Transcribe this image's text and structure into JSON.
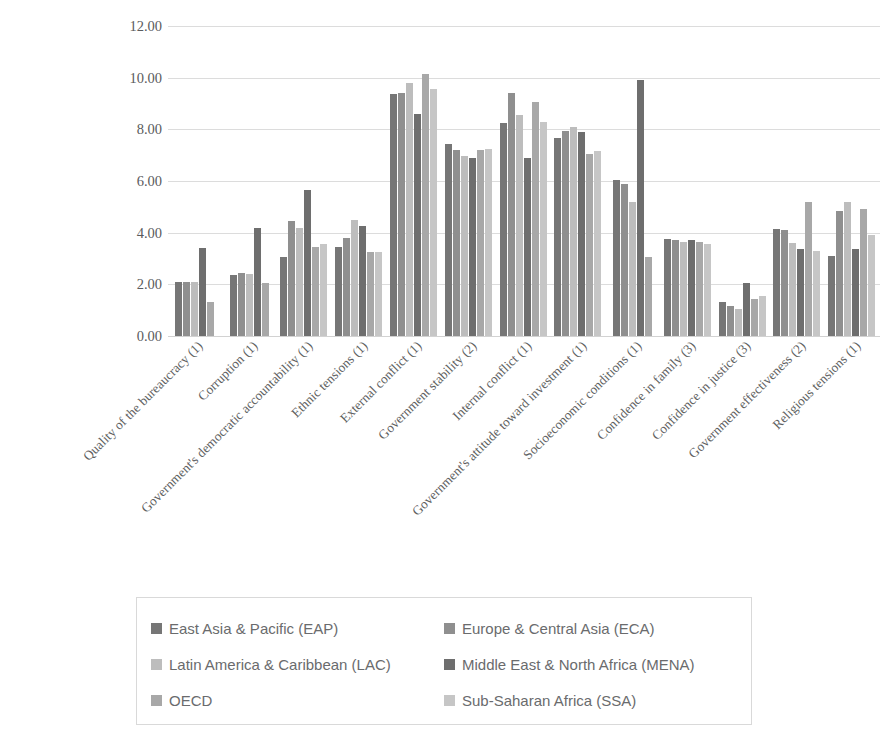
{
  "chart_data": {
    "type": "bar",
    "title": "",
    "xlabel": "",
    "ylabel": "",
    "ylim": [
      0,
      12
    ],
    "ytick_labels": [
      "0.00",
      "2.00",
      "4.00",
      "6.00",
      "8.00",
      "10.00",
      "12.00"
    ],
    "ytick_values": [
      0,
      2,
      4,
      6,
      8,
      10,
      12
    ],
    "grid": true,
    "legend_position": "bottom",
    "categories": [
      "Quality of the bureaucracy (1)",
      "Corruption (1)",
      "Government's democratic accountability (1)",
      "Ethnic tensions (1)",
      "External conflict (1)",
      "Government stability (2)",
      "Internal conflict (1)",
      "Government's attitude toward investment (1)",
      "Socioeconomic conditions (1)",
      "Confidence in family (3)",
      "Confidence in justice (3)",
      "Government effectiveness (2)",
      "Religious tensions (1)"
    ],
    "series": [
      {
        "name": "East Asia & Pacific (EAP)",
        "color": "#767676",
        "values": [
          2.1,
          2.35,
          3.05,
          3.45,
          9.35,
          7.45,
          8.25,
          7.65,
          6.05,
          3.75,
          1.3,
          4.15,
          3.1
        ]
      },
      {
        "name": "Europe & Central Asia (ECA)",
        "color": "#8f8f8f",
        "values": [
          2.1,
          2.45,
          4.45,
          3.8,
          9.4,
          7.2,
          9.4,
          7.95,
          5.9,
          3.7,
          1.15,
          4.1,
          4.85
        ]
      },
      {
        "name": "Latin America & Caribbean (LAC)",
        "color": "#bdbdbd",
        "values": [
          2.1,
          2.4,
          4.2,
          4.5,
          9.8,
          6.95,
          8.55,
          8.1,
          5.2,
          3.65,
          1.05,
          3.6,
          5.2
        ]
      },
      {
        "name": "Middle East & North Africa (MENA)",
        "color": "#6e6e6e",
        "values": [
          3.4,
          4.2,
          5.65,
          4.25,
          8.6,
          6.9,
          6.9,
          7.9,
          9.9,
          3.7,
          2.05,
          3.35,
          3.35
        ]
      },
      {
        "name": "OECD",
        "color": "#a8a8a8",
        "values": [
          1.3,
          2.05,
          3.45,
          3.25,
          10.15,
          7.2,
          9.05,
          7.05,
          3.05,
          3.65,
          1.45,
          5.2,
          4.9
        ]
      },
      {
        "name": "Sub-Saharan Africa (SSA)",
        "color": "#c6c6c6",
        "values": [
          null,
          null,
          3.55,
          3.25,
          9.55,
          7.25,
          8.3,
          7.15,
          null,
          3.55,
          1.55,
          3.3,
          3.9
        ]
      }
    ]
  },
  "legend": {
    "items": [
      {
        "label": "East Asia & Pacific (EAP)",
        "color": "#767676"
      },
      {
        "label": "Europe & Central Asia (ECA)",
        "color": "#8f8f8f"
      },
      {
        "label": "Latin America & Caribbean (LAC)",
        "color": "#bdbdbd"
      },
      {
        "label": "Middle East & North Africa (MENA)",
        "color": "#6e6e6e"
      },
      {
        "label": "OECD",
        "color": "#a8a8a8"
      },
      {
        "label": "Sub-Saharan Africa (SSA)",
        "color": "#c6c6c6"
      }
    ]
  },
  "axis": {
    "gridline_color": "#dcdcdc",
    "tick_text_color": "#5a5b5d"
  }
}
